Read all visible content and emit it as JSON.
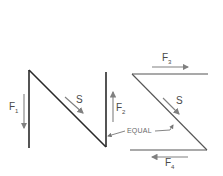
{
  "figure": {
    "left_diagram": {
      "name": "N-shaped member",
      "force_labels": [
        {
          "id": "F1",
          "letter": "F",
          "subscript": "1",
          "direction": "down"
        },
        {
          "id": "F2",
          "letter": "F",
          "subscript": "2",
          "direction": "up"
        }
      ],
      "shear_label": "S"
    },
    "right_diagram": {
      "name": "Z-shaped member",
      "force_labels": [
        {
          "id": "F3",
          "letter": "F",
          "subscript": "3",
          "direction": "right"
        },
        {
          "id": "F4",
          "letter": "F",
          "subscript": "4",
          "direction": "left"
        }
      ],
      "shear_label": "S"
    },
    "annotation": "EQUAL",
    "colors": {
      "member": "#2a2a2a",
      "arrow": "#808080",
      "text": "#4a4a4a"
    }
  }
}
